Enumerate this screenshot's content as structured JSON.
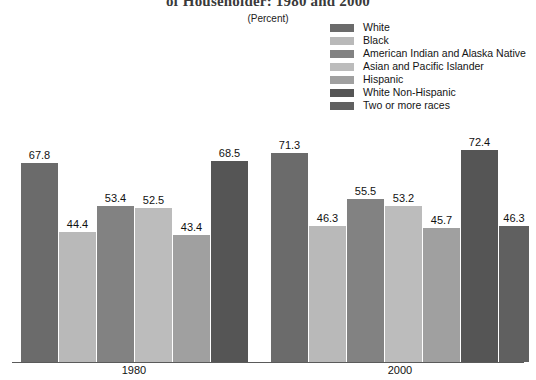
{
  "chart_data": {
    "type": "bar",
    "title": "of Householder:  1980 and 2000",
    "subtitle": "(Percent)",
    "xlabel": "",
    "ylabel": "",
    "ylim": [
      0,
      80
    ],
    "grid": false,
    "legend_position": "top-right",
    "categories": [
      "1980",
      "2000"
    ],
    "series": [
      {
        "name": "White",
        "color": "#6b6b6b",
        "values": [
          67.8,
          71.3
        ]
      },
      {
        "name": "Black",
        "color": "#b9b9b9",
        "values": [
          44.4,
          46.3
        ]
      },
      {
        "name": "American Indian and Alaska Native",
        "color": "#828282",
        "values": [
          53.4,
          55.5
        ]
      },
      {
        "name": "Asian and Pacific Islander",
        "color": "#bcbcbc",
        "values": [
          52.5,
          53.2
        ]
      },
      {
        "name": "Hispanic",
        "color": "#a0a0a0",
        "values": [
          43.4,
          45.7
        ]
      },
      {
        "name": "White Non-Hispanic",
        "color": "#555555",
        "values": [
          68.5,
          72.4
        ]
      },
      {
        "name": "Two or more races",
        "color": "#606060",
        "values": [
          null,
          46.3
        ]
      }
    ],
    "bars": [
      {
        "group": "1980",
        "series": "White",
        "value": 67.8,
        "label": "67.8",
        "color": "#6b6b6b",
        "x": 21,
        "w": 37
      },
      {
        "group": "1980",
        "series": "Black",
        "value": 44.4,
        "label": "44.4",
        "color": "#b9b9b9",
        "x": 59,
        "w": 37
      },
      {
        "group": "1980",
        "series": "American Indian and Alaska Native",
        "value": 53.4,
        "label": "53.4",
        "color": "#828282",
        "x": 97,
        "w": 37
      },
      {
        "group": "1980",
        "series": "Asian and Pacific Islander",
        "value": 52.5,
        "label": "52.5",
        "color": "#bcbcbc",
        "x": 135,
        "w": 37
      },
      {
        "group": "1980",
        "series": "Hispanic",
        "value": 43.4,
        "label": "43.4",
        "color": "#a0a0a0",
        "x": 173,
        "w": 37
      },
      {
        "group": "1980",
        "series": "White Non-Hispanic",
        "value": 68.5,
        "label": "68.5",
        "color": "#555555",
        "x": 211,
        "w": 37
      },
      {
        "group": "2000",
        "series": "White",
        "value": 71.3,
        "label": "71.3",
        "color": "#6b6b6b",
        "x": 271,
        "w": 37
      },
      {
        "group": "2000",
        "series": "Black",
        "value": 46.3,
        "label": "46.3",
        "color": "#b9b9b9",
        "x": 309,
        "w": 37
      },
      {
        "group": "2000",
        "series": "American Indian and Alaska Native",
        "value": 55.5,
        "label": "55.5",
        "color": "#828282",
        "x": 347,
        "w": 37
      },
      {
        "group": "2000",
        "series": "Asian and Pacific Islander",
        "value": 53.2,
        "label": "53.2",
        "color": "#bcbcbc",
        "x": 385,
        "w": 37
      },
      {
        "group": "2000",
        "series": "Hispanic",
        "value": 45.7,
        "label": "45.7",
        "color": "#a0a0a0",
        "x": 423,
        "w": 37
      },
      {
        "group": "2000",
        "series": "White Non-Hispanic",
        "value": 72.4,
        "label": "72.4",
        "color": "#555555",
        "x": 461,
        "w": 37
      },
      {
        "group": "2000",
        "series": "Two or more races",
        "value": 46.3,
        "label": "46.3",
        "color": "#606060",
        "x": 499,
        "w": 30
      }
    ],
    "group_labels": [
      {
        "text": "1980",
        "center": 134
      },
      {
        "text": "2000",
        "center": 400
      }
    ]
  }
}
